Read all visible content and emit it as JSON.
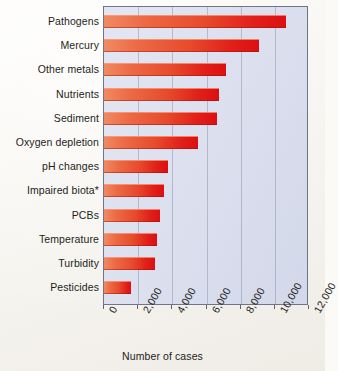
{
  "chart_data": {
    "type": "bar",
    "orientation": "horizontal",
    "title": "",
    "xlabel": "Number of cases",
    "ylabel": "",
    "xlim": [
      0,
      12000
    ],
    "xticks": [
      0,
      2000,
      4000,
      6000,
      8000,
      10000,
      12000
    ],
    "xtick_labels": [
      "0",
      "2,000",
      "4,000",
      "6,000",
      "8,000",
      "10,000",
      "12,000"
    ],
    "grid": "vertical",
    "legend": "none",
    "categories": [
      "Pathogens",
      "Mercury",
      "Other metals",
      "Nutrients",
      "Sediment",
      "Oxygen depletion",
      "pH changes",
      "Impaired biota*",
      "PCBs",
      "Temperature",
      "Turbidity",
      "Pesticides"
    ],
    "values": [
      10650,
      9100,
      7170,
      6760,
      6590,
      5530,
      3760,
      3500,
      3300,
      3120,
      3000,
      1590
    ],
    "colors": {
      "bar_gradient_start": "#f08a63",
      "bar_gradient_end": "#dc0f12",
      "plot_background": "#dde1ef",
      "gridline": "#78809660",
      "frame": "#6f7585",
      "page_background": "#f6f4ef",
      "text": "#1d1d20"
    }
  }
}
